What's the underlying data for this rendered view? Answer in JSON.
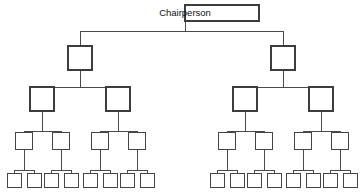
{
  "diagram": {
    "type": "organizational-chart",
    "orientation": "top-down",
    "branching": "binary",
    "levels_count": 5,
    "background_color": "#ffffff",
    "line_color": "#4a4a4a",
    "box_fill_color": "#ffffff",
    "box_border_color": "#3d3d3d",
    "label_color": "#111111"
  },
  "levels": [
    {
      "index": 1,
      "name": "chairperson-level",
      "node_count": 1,
      "labeled": true,
      "box_width": 74,
      "box_height": 16
    },
    {
      "index": 2,
      "name": "second-level",
      "node_count": 2,
      "labeled": false,
      "box_width": 24,
      "box_height": 24
    },
    {
      "index": 3,
      "name": "third-level",
      "node_count": 4,
      "labeled": false,
      "box_width": 24,
      "box_height": 24
    },
    {
      "index": 4,
      "name": "fourth-level",
      "node_count": 8,
      "labeled": false,
      "box_width": 17,
      "box_height": 17
    },
    {
      "index": 5,
      "name": "fifth-level",
      "node_count": 16,
      "labeled": false,
      "box_width": 14,
      "box_height": 14
    }
  ],
  "nodes": {
    "level1": [
      {
        "id": "n1",
        "label": "Chairperson",
        "x": 185,
        "y": 13,
        "w": 74,
        "h": 16
      }
    ],
    "level2": [
      {
        "id": "n2a",
        "label": "",
        "x": 80,
        "y": 58,
        "w": 24,
        "h": 24
      },
      {
        "id": "n2b",
        "label": "",
        "x": 283,
        "y": 58,
        "w": 24,
        "h": 24
      }
    ],
    "level3": [
      {
        "id": "n3a",
        "label": "",
        "x": 42,
        "y": 99,
        "w": 24,
        "h": 24
      },
      {
        "id": "n3b",
        "label": "",
        "x": 118,
        "y": 99,
        "w": 24,
        "h": 24
      },
      {
        "id": "n3c",
        "label": "",
        "x": 245,
        "y": 99,
        "w": 24,
        "h": 24
      },
      {
        "id": "n3d",
        "label": "",
        "x": 321,
        "y": 99,
        "w": 24,
        "h": 24
      }
    ],
    "level4": [
      {
        "id": "n4a",
        "label": "",
        "x": 24,
        "y": 140,
        "w": 17,
        "h": 17
      },
      {
        "id": "n4b",
        "label": "",
        "x": 61,
        "y": 140,
        "w": 17,
        "h": 17
      },
      {
        "id": "n4c",
        "label": "",
        "x": 100,
        "y": 140,
        "w": 17,
        "h": 17
      },
      {
        "id": "n4d",
        "label": "",
        "x": 137,
        "y": 140,
        "w": 17,
        "h": 17
      },
      {
        "id": "n4e",
        "label": "",
        "x": 227,
        "y": 140,
        "w": 17,
        "h": 17
      },
      {
        "id": "n4f",
        "label": "",
        "x": 264,
        "y": 140,
        "w": 17,
        "h": 17
      },
      {
        "id": "n4g",
        "label": "",
        "x": 303,
        "y": 140,
        "w": 17,
        "h": 17
      },
      {
        "id": "n4h",
        "label": "",
        "x": 340,
        "y": 140,
        "w": 17,
        "h": 17
      }
    ],
    "level5": [
      {
        "id": "n5a",
        "label": "",
        "x": 14,
        "y": 180,
        "w": 14,
        "h": 14
      },
      {
        "id": "n5b",
        "label": "",
        "x": 34,
        "y": 180,
        "w": 14,
        "h": 14
      },
      {
        "id": "n5c",
        "label": "",
        "x": 51,
        "y": 180,
        "w": 14,
        "h": 14
      },
      {
        "id": "n5d",
        "label": "",
        "x": 71,
        "y": 180,
        "w": 14,
        "h": 14
      },
      {
        "id": "n5e",
        "label": "",
        "x": 90,
        "y": 180,
        "w": 14,
        "h": 14
      },
      {
        "id": "n5f",
        "label": "",
        "x": 110,
        "y": 180,
        "w": 14,
        "h": 14
      },
      {
        "id": "n5g",
        "label": "",
        "x": 127,
        "y": 180,
        "w": 14,
        "h": 14
      },
      {
        "id": "n5h",
        "label": "",
        "x": 147,
        "y": 180,
        "w": 14,
        "h": 14
      },
      {
        "id": "n5i",
        "label": "",
        "x": 217,
        "y": 180,
        "w": 14,
        "h": 14
      },
      {
        "id": "n5j",
        "label": "",
        "x": 237,
        "y": 180,
        "w": 14,
        "h": 14
      },
      {
        "id": "n5k",
        "label": "",
        "x": 254,
        "y": 180,
        "w": 14,
        "h": 14
      },
      {
        "id": "n5l",
        "label": "",
        "x": 274,
        "y": 180,
        "w": 14,
        "h": 14
      },
      {
        "id": "n5m",
        "label": "",
        "x": 293,
        "y": 180,
        "w": 14,
        "h": 14
      },
      {
        "id": "n5n",
        "label": "",
        "x": 313,
        "y": 180,
        "w": 14,
        "h": 14
      },
      {
        "id": "n5o",
        "label": "",
        "x": 330,
        "y": 180,
        "w": 14,
        "h": 14
      },
      {
        "id": "n5p",
        "label": "",
        "x": 350,
        "y": 180,
        "w": 14,
        "h": 14
      }
    ]
  },
  "connectors": {
    "level1_to_level2": {
      "stem_from": {
        "x": 185,
        "y": 21
      },
      "bus_y": 31,
      "bus_x1": 80,
      "bus_x2": 283
    },
    "level2_to_level3_left": {
      "bus_y": 87,
      "bus_x1": 42,
      "bus_x2": 118,
      "parent_x": 80
    },
    "level2_to_level3_right": {
      "bus_y": 87,
      "bus_x1": 245,
      "bus_x2": 321,
      "parent_x": 283
    },
    "level3_to_level4": {
      "bus_y": 131
    },
    "level4_to_level5": {
      "bus_y": 170
    }
  }
}
